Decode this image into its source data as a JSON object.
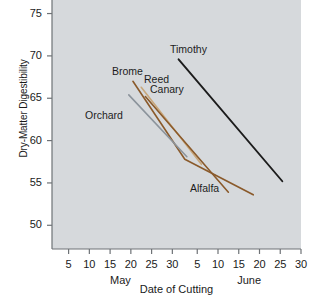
{
  "chart_data": {
    "type": "line",
    "title": "",
    "xlabel": "Date of Cutting",
    "ylabel": "Dry-Matter Digestibility",
    "xlim": [
      1,
      61
    ],
    "ylim": [
      47.2,
      76.6
    ],
    "grid": false,
    "legend_position": "inline-labels",
    "background_color": "#d6d9dc",
    "x_tick_labels": [
      "5",
      "10",
      "15",
      "20",
      "25",
      "30",
      "5",
      "10",
      "15",
      "20",
      "25",
      "30"
    ],
    "x_tick_values": [
      5,
      10,
      15,
      20,
      25,
      30,
      36,
      41,
      46,
      51,
      56,
      61
    ],
    "x_group_labels": [
      "May",
      "June"
    ],
    "y_tick_labels": [
      "50",
      "55",
      "60",
      "65",
      "70",
      "75"
    ],
    "y_tick_values": [
      50,
      55,
      60,
      65,
      70,
      75
    ],
    "series": [
      {
        "name": "Timothy",
        "color": "#1c1c1c",
        "width": 1.9,
        "points": [
          [
            31.5,
            69.6
          ],
          [
            56.5,
            55.2
          ]
        ]
      },
      {
        "name": "Brome",
        "color": "#8a5a2b",
        "width": 1.6,
        "points": [
          [
            20.5,
            67.0
          ],
          [
            33.0,
            57.8
          ],
          [
            49.5,
            53.6
          ]
        ]
      },
      {
        "name": "Reed Canary",
        "color": "#c9a87c",
        "width": 1.6,
        "points": [
          [
            22.5,
            66.3
          ],
          [
            37.0,
            57.2
          ]
        ]
      },
      {
        "name": "Orchard",
        "color": "#8c949c",
        "width": 1.6,
        "points": [
          [
            19.5,
            65.4
          ],
          [
            33.5,
            58.1
          ]
        ]
      },
      {
        "name": "Alfalfa",
        "color": "#8a5a2b",
        "width": 1.6,
        "points": [
          [
            23.5,
            65.2
          ],
          [
            43.5,
            53.9
          ]
        ]
      }
    ],
    "annotations": [
      {
        "text": "Timothy",
        "x": 170,
        "y": 43
      },
      {
        "text": "Brome",
        "x": 112,
        "y": 65
      },
      {
        "text": "Reed",
        "x": 144,
        "y": 73
      },
      {
        "text": "Canary",
        "x": 150,
        "y": 83
      },
      {
        "text": "Orchard",
        "x": 85,
        "y": 109
      },
      {
        "text": "Alfalfa",
        "x": 190,
        "y": 182
      }
    ]
  }
}
